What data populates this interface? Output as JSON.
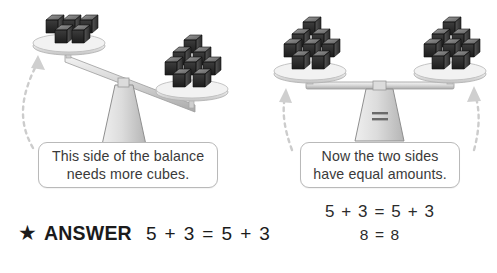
{
  "page": {
    "background_color": "#ffffff",
    "width": 497,
    "height": 273
  },
  "illustration_left": {
    "name": "unbalanced-scale",
    "state": "tilted-right",
    "left_pan": {
      "cube_count": 5,
      "label": "5"
    },
    "right_pan": {
      "cube_count": 8,
      "label": "8"
    },
    "fulcrum_symbol": ""
  },
  "illustration_right": {
    "name": "balanced-scale",
    "state": "level",
    "left_pan": {
      "cube_count": 8,
      "label": "8"
    },
    "right_pan": {
      "cube_count": 8,
      "label": "8"
    },
    "fulcrum_symbol": "="
  },
  "callouts": {
    "left": {
      "line1": "This side of the balance",
      "line2": "needs more cubes."
    },
    "right": {
      "line1": "Now the two sides",
      "line2": "have equal amounts."
    }
  },
  "equations": {
    "line1": "5 + 3 = 5 + 3",
    "line2": "8 = 8"
  },
  "answer": {
    "star_icon": "★",
    "label": "ANSWER",
    "equation": "5 + 3 = 5 + 3"
  },
  "colors": {
    "text": "#2b2b2b",
    "callout_border": "#b9b9b9",
    "arrow": "#cccccc",
    "cube_dark": "#2a2a2a",
    "cube_mid": "#4a4a4a",
    "cube_light": "#8e8e8e",
    "pan": "#e2e2e2",
    "beam": "#d6d6d6",
    "fulcrum": "#d9d9d9"
  }
}
